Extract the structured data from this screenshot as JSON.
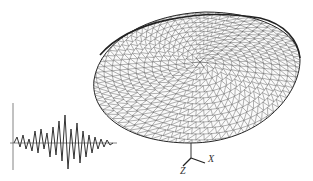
{
  "figure": {
    "dome": {
      "type": "triangulated-lattice-dome",
      "stroke": "#333333"
    },
    "seismic_wave": {
      "type": "accelerogram",
      "stroke": "#333333"
    },
    "axes": {
      "z_label": "Z",
      "x_label": "X"
    }
  }
}
